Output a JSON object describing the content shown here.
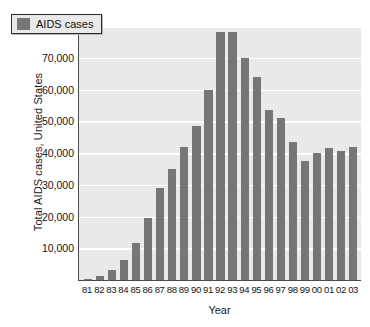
{
  "chart_data": {
    "type": "bar",
    "title": "",
    "xlabel": "Year",
    "ylabel": "Total AIDS cases, United States",
    "categories": [
      "81",
      "82",
      "83",
      "84",
      "85",
      "86",
      "87",
      "88",
      "89",
      "90",
      "91",
      "92",
      "93",
      "94",
      "95",
      "96",
      "97",
      "98",
      "99",
      "00",
      "01",
      "02",
      "03"
    ],
    "values": [
      300,
      1200,
      3000,
      6400,
      11800,
      19500,
      29000,
      35000,
      42000,
      48500,
      60000,
      78000,
      78000,
      70000,
      64000,
      53500,
      51000,
      43500,
      37500,
      40000,
      41500,
      40500,
      42000
    ],
    "series": [
      {
        "name": "AIDS cases",
        "values": [
          300,
          1200,
          3000,
          6400,
          11800,
          19500,
          29000,
          35000,
          42000,
          48500,
          60000,
          78000,
          78000,
          70000,
          64000,
          53500,
          51000,
          43500,
          37500,
          40000,
          41500,
          40500,
          42000
        ]
      }
    ],
    "ylim": [
      0,
      80000
    ],
    "yticks": [
      10000,
      20000,
      30000,
      40000,
      50000,
      60000,
      70000,
      80000
    ],
    "ytick_labels": [
      "10,000",
      "20,000",
      "30,000",
      "40,000",
      "50,000",
      "60,000",
      "70,000",
      "80,000"
    ],
    "grid": true,
    "grid_color": "#ffffff",
    "legend": {
      "position": "top-left-inside",
      "entries": [
        {
          "label": "AIDS cases",
          "color": "#767676"
        }
      ]
    },
    "colors": {
      "bar": "#767676",
      "plot_background": "#e9e9e9",
      "page_background": "#ffffff",
      "axis": "#4a4a4a",
      "text": "#141414"
    }
  }
}
